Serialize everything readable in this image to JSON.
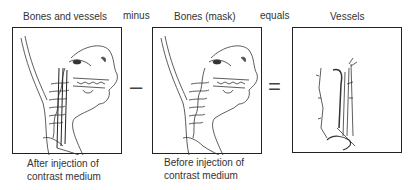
{
  "diagram": {
    "panels": [
      {
        "title": "Bones and vessels",
        "caption_line1": "After injection of",
        "caption_line2": "contrast medium"
      },
      {
        "title": "Bones (mask)",
        "caption_line1": "Before injection of",
        "caption_line2": "contrast medium"
      },
      {
        "title": "Vessels"
      }
    ],
    "operators": [
      {
        "word": "minus",
        "symbol": "–"
      },
      {
        "word": "equals",
        "symbol": "="
      }
    ]
  }
}
